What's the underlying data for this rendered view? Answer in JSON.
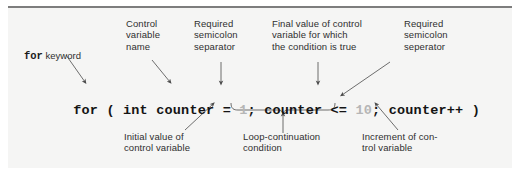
{
  "figure": {
    "kind": "annotated-code-diagram",
    "background_color": "#f5f5f4",
    "rule_color": "#7d7d7d",
    "text_color": "#2f2f2f",
    "code_color": "#141414",
    "literal_color": "#b6b6b6",
    "leader_color": "#555555"
  },
  "code": {
    "full": "for ( int counter = 1; counter <= 10; counter++ )",
    "tokens": [
      {
        "text": "for",
        "style": "bold"
      },
      {
        "text": " ( ",
        "style": "punct"
      },
      {
        "text": "int counter = ",
        "style": "bold"
      },
      {
        "text": "1",
        "style": "literal"
      },
      {
        "text": "; counter <= ",
        "style": "bold"
      },
      {
        "text": "10",
        "style": "literal"
      },
      {
        "text": "; counter++ )",
        "style": "bold"
      }
    ]
  },
  "keyword_label": {
    "keyword": "for",
    "suffix": " keyword"
  },
  "top_labels": [
    {
      "id": "control-variable-name",
      "text": "Control\nvariable\nname"
    },
    {
      "id": "required-semicolon-separator",
      "text": "Required\nsemicolon\nseparator"
    },
    {
      "id": "final-value-of-control-variable",
      "text": "Final value of control\nvariable for which\nthe condition is true"
    },
    {
      "id": "required-semicolon-seperator",
      "text": "Required\nsemicolon\nseperator"
    }
  ],
  "bottom_labels": [
    {
      "id": "initial-value-of-control-variable",
      "text": "Initial value of\ncontrol variable"
    },
    {
      "id": "loop-continuation-condition",
      "text": "Loop-continuation\ncondition"
    },
    {
      "id": "increment-of-control-variable",
      "text": "Increment of con-\ntrol variable"
    }
  ]
}
